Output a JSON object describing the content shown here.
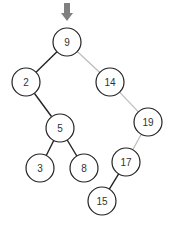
{
  "diagram": {
    "type": "binary-search-tree",
    "pointer": {
      "target": "9",
      "color": "#808080"
    },
    "nodes": [
      {
        "id": "9",
        "label": "9",
        "x": 67,
        "y": 42
      },
      {
        "id": "2",
        "label": "2",
        "x": 26,
        "y": 82
      },
      {
        "id": "14",
        "label": "14",
        "x": 110,
        "y": 82
      },
      {
        "id": "5",
        "label": "5",
        "x": 60,
        "y": 128
      },
      {
        "id": "19",
        "label": "19",
        "x": 148,
        "y": 122
      },
      {
        "id": "3",
        "label": "3",
        "x": 40,
        "y": 168
      },
      {
        "id": "8",
        "label": "8",
        "x": 84,
        "y": 168
      },
      {
        "id": "17",
        "label": "17",
        "x": 126,
        "y": 162
      },
      {
        "id": "15",
        "label": "15",
        "x": 102,
        "y": 201
      }
    ],
    "edges": [
      {
        "from": "9",
        "to": "2",
        "style": "dark"
      },
      {
        "from": "9",
        "to": "14",
        "style": "light"
      },
      {
        "from": "2",
        "to": "5",
        "style": "dark"
      },
      {
        "from": "5",
        "to": "3",
        "style": "dark"
      },
      {
        "from": "5",
        "to": "8",
        "style": "dark"
      },
      {
        "from": "14",
        "to": "19",
        "style": "light"
      },
      {
        "from": "19",
        "to": "17",
        "style": "light"
      },
      {
        "from": "17",
        "to": "15",
        "style": "dark"
      }
    ],
    "colors": {
      "dark": "#222222",
      "light": "#bbbbbb",
      "arrow": "#808080"
    }
  }
}
